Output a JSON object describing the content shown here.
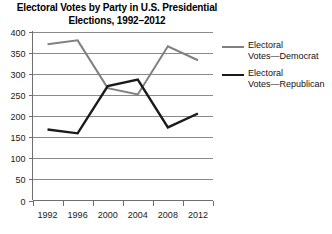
{
  "chart_data": {
    "type": "line",
    "title": "Electoral Votes by Party in U.S. Presidential Elections, 1992–2012",
    "title_line1": "Electoral Votes by Party in U.S. Presidential",
    "title_line2": "Elections, 1992–2012",
    "xlabel": "",
    "ylabel": "",
    "categories": [
      "1992",
      "1996",
      "2000",
      "2004",
      "2008",
      "2012"
    ],
    "x": [
      1992,
      1996,
      2000,
      2004,
      2008,
      2012
    ],
    "ylim": [
      0,
      400
    ],
    "yticks": [
      0,
      50,
      100,
      150,
      200,
      250,
      300,
      350,
      400
    ],
    "ytick_labels": [
      "0",
      "50",
      "100",
      "150",
      "200",
      "250",
      "300",
      "350",
      "400"
    ],
    "grid": "horizontal",
    "legend_position": "right",
    "series": [
      {
        "name": "Electoral Votes—Democrat",
        "legend_line1": "Electoral",
        "legend_line2": "Votes—Democrat",
        "color": "#808080",
        "stroke_width": 2,
        "values": [
          370,
          379,
          266,
          251,
          365,
          332
        ]
      },
      {
        "name": "Electoral Votes—Republican",
        "legend_line1": "Electoral",
        "legend_line2": "Votes—Republican",
        "color": "#1a1a1a",
        "stroke_width": 2.4,
        "values": [
          168,
          159,
          271,
          286,
          173,
          206
        ]
      }
    ]
  },
  "axis": {
    "gridline_color": "#8a8a8a",
    "axis_color": "#6e6e6e"
  }
}
